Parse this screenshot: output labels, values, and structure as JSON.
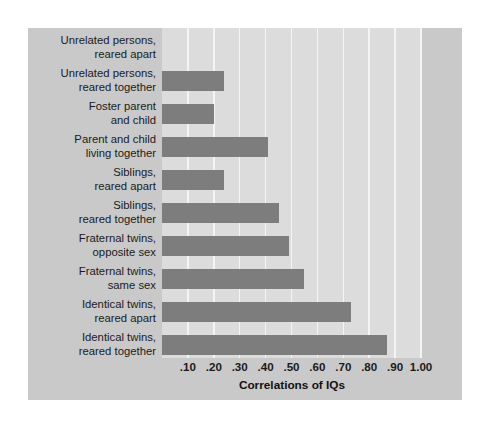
{
  "chart_data": {
    "type": "bar",
    "orientation": "horizontal",
    "title": "",
    "xlabel": "Correlations of IQs",
    "ylabel": "",
    "xlim": [
      0.0,
      1.0
    ],
    "grid": true,
    "legend": "none",
    "xticks": [
      ".10",
      ".20",
      ".30",
      ".40",
      ".50",
      ".60",
      ".70",
      ".80",
      ".90",
      "1.00"
    ],
    "xtick_values": [
      0.1,
      0.2,
      0.3,
      0.4,
      0.5,
      0.6,
      0.7,
      0.8,
      0.9,
      1.0
    ],
    "bar_color": "#7d7d7d",
    "plot_background": "#dcdcdc",
    "panel_background": "#c9c9c9",
    "gridline_color": "#f4f4f4",
    "categories": [
      "Unrelated persons, reared apart",
      "Unrelated persons, reared together",
      "Foster parent and child",
      "Parent and child living together",
      "Siblings, reared apart",
      "Siblings, reared together",
      "Fraternal twins, opposite sex",
      "Fraternal twins, same sex",
      "Identical twins, reared apart",
      "Identical twins, reared together"
    ],
    "category_lines": [
      [
        "Unrelated persons,",
        "reared apart"
      ],
      [
        "Unrelated persons,",
        "reared together"
      ],
      [
        "Foster parent",
        "and child"
      ],
      [
        "Parent and child",
        "living together"
      ],
      [
        "Siblings,",
        "reared apart"
      ],
      [
        "Siblings,",
        "reared together"
      ],
      [
        "Fraternal twins,",
        "opposite sex"
      ],
      [
        "Fraternal twins,",
        "same sex"
      ],
      [
        "Identical twins,",
        "reared apart"
      ],
      [
        "Identical twins,",
        "reared together"
      ]
    ],
    "values": [
      0.0,
      0.24,
      0.2,
      0.41,
      0.24,
      0.45,
      0.49,
      0.55,
      0.73,
      0.87
    ]
  }
}
